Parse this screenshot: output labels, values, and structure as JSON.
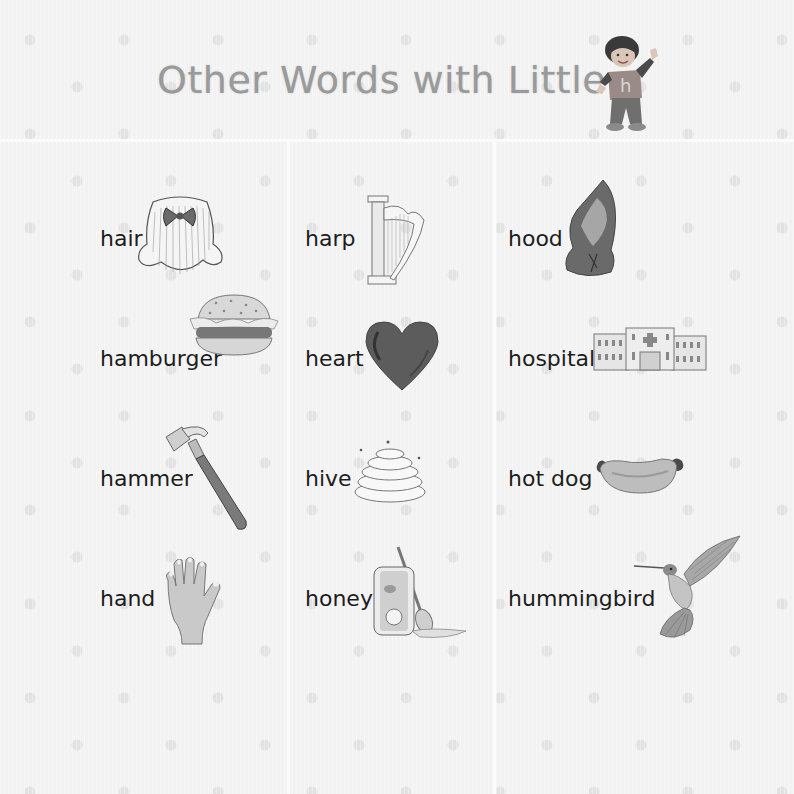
{
  "page": {
    "title": "Other Words with Little",
    "mascot": {
      "name": "little-h-boy",
      "shirt_letter": "h"
    }
  },
  "columns": [
    {
      "items": [
        {
          "word": "hair",
          "icon": "hair-icon"
        },
        {
          "word": "hamburger",
          "icon": "hamburger-icon"
        },
        {
          "word": "hammer",
          "icon": "hammer-icon"
        },
        {
          "word": "hand",
          "icon": "hand-icon"
        }
      ]
    },
    {
      "items": [
        {
          "word": "harp",
          "icon": "harp-icon"
        },
        {
          "word": "heart",
          "icon": "heart-icon"
        },
        {
          "word": "hive",
          "icon": "hive-icon"
        },
        {
          "word": "honey",
          "icon": "honey-icon"
        }
      ]
    },
    {
      "items": [
        {
          "word": "hood",
          "icon": "hood-icon"
        },
        {
          "word": "hospital",
          "icon": "hospital-icon"
        },
        {
          "word": "hot dog",
          "icon": "hot-dog-icon"
        },
        {
          "word": "hummingbird",
          "icon": "hummingbird-icon"
        }
      ]
    }
  ],
  "colors": {
    "background": "#f2f2f2",
    "title": "#9a9a9a",
    "word_text": "#1d1d1d",
    "divider": "#fbfbfb"
  }
}
